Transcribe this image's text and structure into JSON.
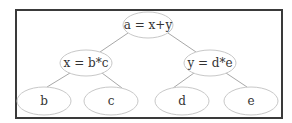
{
  "diagram": {
    "type": "binary expression tree",
    "colors": {
      "frame": "#3a3a3a",
      "edge": "#a8a8a8",
      "node_border": "#c8c8c8",
      "text": "#333333"
    },
    "nodes": [
      {
        "id": "root",
        "label": "a = x+y",
        "cx": 148,
        "cy": 25,
        "rx": 25,
        "ry": 13
      },
      {
        "id": "x",
        "label": "x = b*c",
        "cx": 86,
        "cy": 63,
        "rx": 26,
        "ry": 13
      },
      {
        "id": "y",
        "label": "y = d*e",
        "cx": 210,
        "cy": 63,
        "rx": 26,
        "ry": 13
      },
      {
        "id": "b",
        "label": "b",
        "cx": 44,
        "cy": 101,
        "rx": 27,
        "ry": 14
      },
      {
        "id": "c",
        "label": "c",
        "cx": 111,
        "cy": 101,
        "rx": 27,
        "ry": 14
      },
      {
        "id": "d",
        "label": "d",
        "cx": 182,
        "cy": 101,
        "rx": 27,
        "ry": 14
      },
      {
        "id": "e",
        "label": "e",
        "cx": 251,
        "cy": 101,
        "rx": 27,
        "ry": 14
      }
    ],
    "edges": [
      {
        "from": "root",
        "to": "x",
        "x1": 128,
        "y1": 33,
        "x2": 100,
        "y2": 52
      },
      {
        "from": "root",
        "to": "y",
        "x1": 168,
        "y1": 33,
        "x2": 196,
        "y2": 52
      },
      {
        "from": "x",
        "to": "b",
        "x1": 70,
        "y1": 73,
        "x2": 47,
        "y2": 87
      },
      {
        "from": "x",
        "to": "c",
        "x1": 102,
        "y1": 73,
        "x2": 122,
        "y2": 88
      },
      {
        "from": "y",
        "to": "d",
        "x1": 194,
        "y1": 73,
        "x2": 173,
        "y2": 88
      },
      {
        "from": "y",
        "to": "e",
        "x1": 226,
        "y1": 73,
        "x2": 247,
        "y2": 87
      }
    ]
  }
}
